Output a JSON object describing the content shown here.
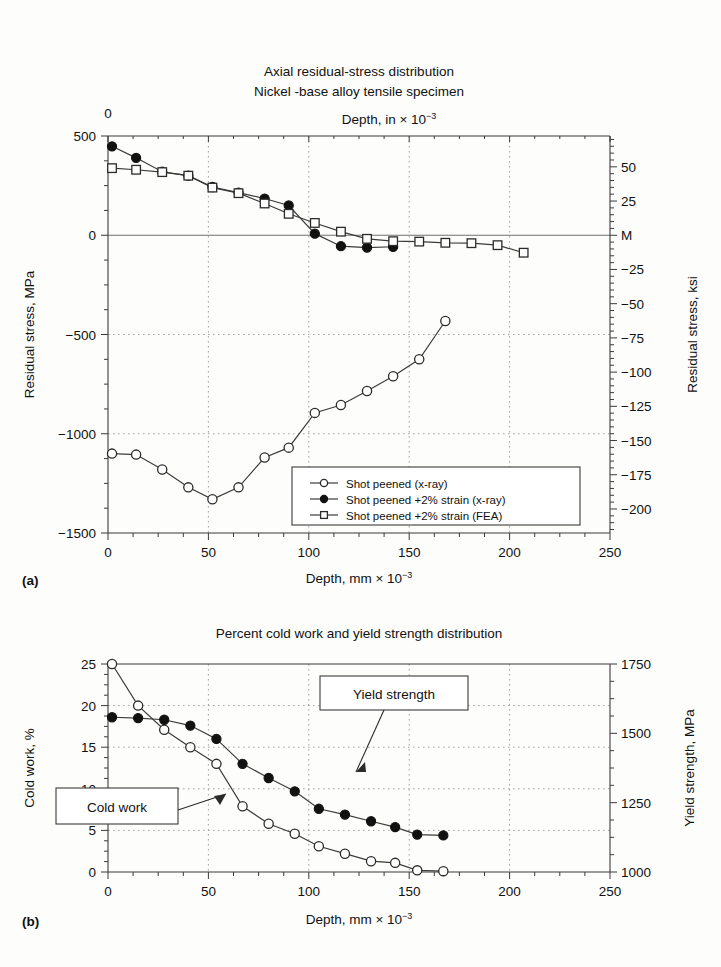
{
  "figure_a": {
    "panel_label": "(a)",
    "title_line1": "Axial residual-stress distribution",
    "title_line2": "Nickel -base alloy tensile specimen",
    "top_axis_label_main": "Depth, in × 10",
    "top_axis_label_sup": "−3",
    "top_axis_tick": "0",
    "x_axis_label_main": "Depth, mm × 10",
    "x_axis_label_sup": "−3",
    "y_left_label": "Residual stress, MPa",
    "y_right_label": "Residual stress, ksi",
    "x_ticks": [
      "0",
      "50",
      "100",
      "150",
      "200",
      "250"
    ],
    "y_left_ticks": [
      "500",
      "0",
      "−500",
      "−1000",
      "−1500"
    ],
    "y_right_ticks": [
      "50",
      "25",
      "M",
      "−25",
      "−50",
      "−75",
      "−100",
      "−125",
      "−150",
      "−175",
      "−200"
    ],
    "legend": [
      {
        "label": "Shot peened (x-ray)",
        "marker": "open-circle"
      },
      {
        "label": "Shot peened +2% strain (x-ray)",
        "marker": "filled-circle"
      },
      {
        "label": "Shot peened +2% strain (FEA)",
        "marker": "open-square"
      }
    ]
  },
  "figure_b": {
    "panel_label": "(b)",
    "title": "Percent cold work and yield strength distribution",
    "x_axis_label_main": "Depth, mm × 10",
    "x_axis_label_sup": "−3",
    "y_left_label": "Cold work, %",
    "y_right_label": "Yield strength, MPa",
    "x_ticks": [
      "0",
      "50",
      "100",
      "150",
      "200",
      "250"
    ],
    "y_left_ticks": [
      "25",
      "20",
      "15",
      "10",
      "5",
      "0"
    ],
    "y_right_ticks": [
      "1750",
      "1500",
      "1250",
      "1000"
    ],
    "annotations": [
      {
        "name": "yield-strength-callout",
        "text": "Yield strength"
      },
      {
        "name": "cold-work-callout",
        "text": "Cold work"
      }
    ]
  },
  "chart_data": [
    {
      "id": "residual-stress",
      "type": "line",
      "title": "Axial residual-stress distribution / Nickel -base alloy tensile specimen",
      "xlabel": "Depth, mm × 10^-3",
      "ylabel": "Residual stress, MPa",
      "y2label": "Residual stress, ksi",
      "xlim": [
        0,
        250
      ],
      "ylim": [
        -1500,
        500
      ],
      "y2lim": [
        -217,
        72
      ],
      "grid": true,
      "legend_position": "lower-right",
      "series": [
        {
          "name": "Shot peened (x-ray)",
          "marker": "open-circle",
          "x": [
            2,
            14,
            27,
            40,
            52,
            65,
            78,
            90,
            103,
            116,
            129,
            142,
            155,
            168
          ],
          "y": [
            -1100,
            -1105,
            -1180,
            -1270,
            -1330,
            -1270,
            -1120,
            -1070,
            -895,
            -855,
            -785,
            -710,
            -625,
            -432
          ]
        },
        {
          "name": "Shot peened +2% strain (x-ray)",
          "marker": "filled-circle",
          "x": [
            2,
            14,
            27,
            40,
            52,
            65,
            78,
            90,
            103,
            116,
            129,
            142
          ],
          "y": [
            448,
            390,
            320,
            300,
            243,
            215,
            185,
            150,
            8,
            -55,
            -62,
            -58
          ]
        },
        {
          "name": "Shot peened +2% strain (FEA)",
          "marker": "open-square",
          "x": [
            2,
            14,
            27,
            40,
            52,
            65,
            78,
            90,
            103,
            116,
            129,
            142,
            155,
            168,
            181,
            194,
            207
          ],
          "y": [
            338,
            330,
            318,
            300,
            240,
            212,
            160,
            108,
            62,
            18,
            -18,
            -30,
            -32,
            -38,
            -40,
            -50,
            -88
          ]
        }
      ]
    },
    {
      "id": "cold-work-yield-strength",
      "type": "line",
      "title": "Percent cold work and yield strength distribution",
      "xlabel": "Depth, mm × 10^-3",
      "ylabel": "Cold work, %",
      "y2label": "Yield strength, MPa",
      "xlim": [
        0,
        250
      ],
      "ylim": [
        0,
        25
      ],
      "y2lim": [
        1000,
        1750
      ],
      "grid": true,
      "series": [
        {
          "name": "Cold work",
          "marker": "open-circle",
          "x": [
            2,
            15,
            28,
            41,
            54,
            67,
            80,
            93,
            105,
            118,
            131,
            143,
            154,
            167
          ],
          "y": [
            25.0,
            20.0,
            17.1,
            15.0,
            13.0,
            7.9,
            5.8,
            4.6,
            3.1,
            2.2,
            1.3,
            1.1,
            0.2,
            0.1
          ]
        },
        {
          "name": "Yield strength",
          "marker": "filled-circle",
          "x": [
            2,
            15,
            28,
            41,
            54,
            67,
            80,
            93,
            105,
            118,
            131,
            143,
            154,
            167
          ],
          "y": [
            18.6,
            18.5,
            18.3,
            17.6,
            16.0,
            13.0,
            11.3,
            9.7,
            7.6,
            6.9,
            6.1,
            5.4,
            4.5,
            4.4
          ]
        }
      ]
    }
  ]
}
